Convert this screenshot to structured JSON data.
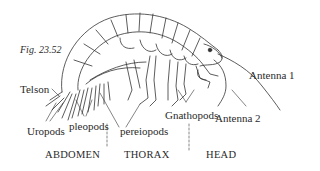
{
  "figure": {
    "caption": "Fig. 23.52"
  },
  "labels": {
    "telson": "Telson",
    "uropods": "Uropods",
    "pleopods": "pleopods",
    "pereiopods": "pereiopods",
    "gnathopods": "Gnathopods",
    "antenna1": "Antenna 1",
    "antenna2": "Antenna 2"
  },
  "regions": {
    "abdomen": "ABDOMEN",
    "thorax": "THORAX",
    "head": "HEAD"
  },
  "colors": {
    "ink": "#2a2a2a",
    "background": "#ffffff"
  }
}
